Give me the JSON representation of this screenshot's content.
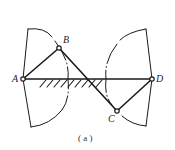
{
  "diagram": {
    "type": "four-bar linkage (crossed), swept regions",
    "points": {
      "A": {
        "label": "A",
        "x": 23,
        "y": 79
      },
      "B": {
        "label": "B",
        "x": 59,
        "y": 48
      },
      "C": {
        "label": "C",
        "x": 117,
        "y": 111
      },
      "D": {
        "label": "D",
        "x": 152,
        "y": 79
      }
    },
    "links": [
      {
        "from": "A",
        "to": "B"
      },
      {
        "from": "B",
        "to": "C"
      },
      {
        "from": "C",
        "to": "D"
      },
      {
        "from": "A",
        "to": "D",
        "ground": true
      }
    ],
    "caption": "( a )",
    "colors": {
      "stroke": "#1a1a1a",
      "background": "#ffffff"
    }
  }
}
